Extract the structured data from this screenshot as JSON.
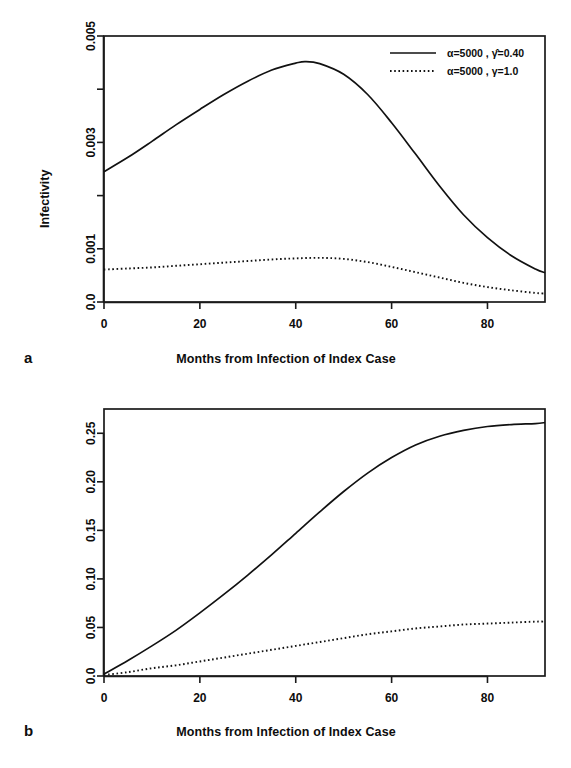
{
  "figure": {
    "panels": [
      {
        "letter": "a",
        "xlabel": "Months from Infection of Index Case",
        "ylabel": "Infectivity"
      },
      {
        "letter": "b",
        "xlabel": "Months from Infection of Index Case",
        "ylabel": "Cumulative Infectivity"
      }
    ]
  },
  "chart_data": [
    {
      "type": "line",
      "panel": "a",
      "title": "",
      "xlabel": "Months from Infection of Index Case",
      "ylabel": "Infectivity",
      "xlim": [
        0,
        92
      ],
      "ylim": [
        0,
        0.005
      ],
      "xticks": [
        0,
        20,
        40,
        60,
        80
      ],
      "xticklabels": [
        "0",
        "20",
        "40",
        "60",
        "80"
      ],
      "yticks": [
        0.0,
        0.001,
        0.002,
        0.003,
        0.004,
        0.005
      ],
      "yticklabels": [
        "0.0",
        "0.001",
        "",
        "0.003",
        "",
        "0.005"
      ],
      "grid": false,
      "legend_position": "top-right",
      "series": [
        {
          "name": "α=5000 , γ̂=0.40",
          "style": "solid",
          "x": [
            0,
            5,
            10,
            15,
            20,
            25,
            30,
            35,
            40,
            42,
            45,
            50,
            55,
            60,
            65,
            70,
            75,
            80,
            85,
            90,
            92
          ],
          "values": [
            0.00245,
            0.00272,
            0.00302,
            0.00333,
            0.00362,
            0.0039,
            0.00415,
            0.00436,
            0.00449,
            0.00452,
            0.00448,
            0.00428,
            0.0039,
            0.00337,
            0.00278,
            0.00218,
            0.00164,
            0.00121,
            0.00087,
            0.00062,
            0.00055
          ]
        },
        {
          "name": "α=5000 , γ=1.0",
          "style": "dotted",
          "x": [
            0,
            5,
            10,
            15,
            20,
            25,
            30,
            35,
            40,
            45,
            50,
            55,
            60,
            65,
            70,
            75,
            80,
            85,
            90,
            92
          ],
          "values": [
            0.00061,
            0.00063,
            0.00065,
            0.00068,
            0.00071,
            0.00074,
            0.00077,
            0.0008,
            0.00082,
            0.00083,
            0.00081,
            0.00075,
            0.00066,
            0.00056,
            0.00046,
            0.00036,
            0.00028,
            0.00022,
            0.00017,
            0.00016
          ]
        }
      ]
    },
    {
      "type": "line",
      "panel": "b",
      "title": "",
      "xlabel": "Months from Infection of Index Case",
      "ylabel": "Cumulative Infectivity",
      "xlim": [
        0,
        92
      ],
      "ylim": [
        0,
        0.275
      ],
      "xticks": [
        0,
        20,
        40,
        60,
        80
      ],
      "xticklabels": [
        "0",
        "20",
        "40",
        "60",
        "80"
      ],
      "yticks": [
        0.0,
        0.05,
        0.1,
        0.15,
        0.2,
        0.25
      ],
      "yticklabels": [
        "0.0",
        "0.05",
        "0.10",
        "0.15",
        "0.20",
        "0.25"
      ],
      "grid": false,
      "legend_position": "none",
      "series": [
        {
          "name": "α=5000 , γ̂=0.40",
          "style": "solid",
          "x": [
            0,
            5,
            10,
            15,
            20,
            25,
            30,
            35,
            40,
            45,
            50,
            55,
            60,
            65,
            70,
            75,
            80,
            85,
            90,
            92
          ],
          "values": [
            0.002,
            0.016,
            0.031,
            0.047,
            0.065,
            0.084,
            0.104,
            0.125,
            0.147,
            0.169,
            0.19,
            0.209,
            0.225,
            0.238,
            0.247,
            0.253,
            0.257,
            0.259,
            0.26,
            0.261
          ]
        },
        {
          "name": "α=5000 , γ=1.0",
          "style": "dotted",
          "x": [
            0,
            5,
            10,
            15,
            20,
            25,
            30,
            35,
            40,
            45,
            50,
            55,
            60,
            65,
            70,
            75,
            80,
            85,
            90,
            92
          ],
          "values": [
            0.001,
            0.004,
            0.008,
            0.011,
            0.015,
            0.019,
            0.023,
            0.027,
            0.031,
            0.035,
            0.039,
            0.043,
            0.046,
            0.049,
            0.051,
            0.053,
            0.054,
            0.055,
            0.056,
            0.056
          ]
        }
      ]
    }
  ],
  "legend": {
    "entries": [
      {
        "label": "α=5000 , γ̂=0.40",
        "style": "solid"
      },
      {
        "label": "α=5000 , γ=1.0",
        "style": "dotted"
      }
    ]
  },
  "colors": {
    "ink": "#111111",
    "background": "#ffffff"
  }
}
